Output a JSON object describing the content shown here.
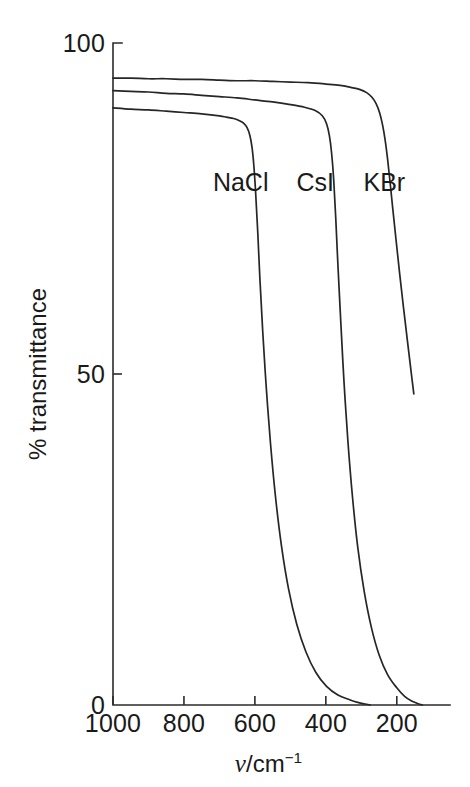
{
  "chart_data": {
    "type": "line",
    "title": "",
    "subtitle": "",
    "xlabel": "v/cm^-1",
    "xlabel_symbol": "ν",
    "xlabel_unit": "/cm",
    "xlabel_exponent": "−1",
    "ylabel": "% transmittance",
    "xlim": [
      1000,
      50
    ],
    "ylim": [
      0,
      100
    ],
    "x_ticks": [
      1000,
      800,
      600,
      400,
      200
    ],
    "x_tick_labels": [
      "1000",
      "800",
      "600",
      "400",
      "200"
    ],
    "y_ticks": [
      0,
      50,
      100
    ],
    "y_tick_labels": [
      "0",
      "50",
      "100"
    ],
    "x_axis_inverted": true,
    "grid": false,
    "legend": "inline-labels",
    "legend_position": "on-plot",
    "series": [
      {
        "name": "NaCl",
        "label": "NaCl",
        "plateau_transmittance": 89,
        "cutoff_wavenumber": 590,
        "zero_wavenumber": 285,
        "label_x": 640,
        "label_y": 79,
        "points": [
          [
            1000,
            90.2
          ],
          [
            950,
            90.0
          ],
          [
            900,
            89.9
          ],
          [
            850,
            89.7
          ],
          [
            800,
            89.5
          ],
          [
            750,
            89.3
          ],
          [
            700,
            89.0
          ],
          [
            680,
            88.8
          ],
          [
            660,
            88.6
          ],
          [
            645,
            88.3
          ],
          [
            632,
            87.9
          ],
          [
            622,
            87.2
          ],
          [
            614,
            86.0
          ],
          [
            608,
            84.2
          ],
          [
            603,
            81.5
          ],
          [
            598,
            77.5
          ],
          [
            592,
            71.5
          ],
          [
            586,
            64.5
          ],
          [
            578,
            56.5
          ],
          [
            568,
            48.0
          ],
          [
            556,
            39.5
          ],
          [
            542,
            31.5
          ],
          [
            525,
            24.0
          ],
          [
            505,
            17.5
          ],
          [
            482,
            12.2
          ],
          [
            456,
            8.0
          ],
          [
            428,
            4.9
          ],
          [
            398,
            2.8
          ],
          [
            366,
            1.5
          ],
          [
            333,
            0.8
          ],
          [
            310,
            0.4
          ],
          [
            290,
            0.15
          ],
          [
            275,
            0.0
          ]
        ]
      },
      {
        "name": "CsI",
        "label": "CsI",
        "plateau_transmittance": 92,
        "cutoff_wavenumber": 380,
        "zero_wavenumber": 150,
        "label_x": 430,
        "label_y": 79,
        "points": [
          [
            1000,
            92.8
          ],
          [
            950,
            92.7
          ],
          [
            900,
            92.6
          ],
          [
            850,
            92.4
          ],
          [
            800,
            92.3
          ],
          [
            750,
            92.1
          ],
          [
            700,
            91.9
          ],
          [
            650,
            91.7
          ],
          [
            600,
            91.4
          ],
          [
            550,
            91.1
          ],
          [
            500,
            90.7
          ],
          [
            460,
            90.3
          ],
          [
            430,
            89.8
          ],
          [
            410,
            89.0
          ],
          [
            398,
            87.8
          ],
          [
            390,
            86.0
          ],
          [
            384,
            83.5
          ],
          [
            378,
            79.5
          ],
          [
            372,
            73.5
          ],
          [
            366,
            66.5
          ],
          [
            358,
            58.0
          ],
          [
            349,
            49.0
          ],
          [
            338,
            40.0
          ],
          [
            325,
            31.5
          ],
          [
            310,
            23.8
          ],
          [
            292,
            17.2
          ],
          [
            272,
            11.8
          ],
          [
            250,
            7.6
          ],
          [
            226,
            4.6
          ],
          [
            200,
            2.6
          ],
          [
            178,
            1.3
          ],
          [
            158,
            0.6
          ],
          [
            140,
            0.2
          ],
          [
            128,
            0.0
          ]
        ]
      },
      {
        "name": "KBr",
        "label": "KBr",
        "plateau_transmittance": 94,
        "cutoff_wavenumber": 195,
        "zero_wavenumber": null,
        "truncated_at_right_edge": true,
        "label_x": 235,
        "label_y": 79,
        "points": [
          [
            1000,
            94.7
          ],
          [
            950,
            94.7
          ],
          [
            900,
            94.6
          ],
          [
            850,
            94.6
          ],
          [
            800,
            94.5
          ],
          [
            750,
            94.5
          ],
          [
            700,
            94.4
          ],
          [
            650,
            94.3
          ],
          [
            600,
            94.3
          ],
          [
            550,
            94.2
          ],
          [
            500,
            94.1
          ],
          [
            450,
            94.0
          ],
          [
            400,
            93.8
          ],
          [
            360,
            93.6
          ],
          [
            330,
            93.3
          ],
          [
            305,
            93.0
          ],
          [
            285,
            92.5
          ],
          [
            270,
            91.8
          ],
          [
            258,
            90.8
          ],
          [
            248,
            89.4
          ],
          [
            240,
            87.6
          ],
          [
            233,
            85.4
          ],
          [
            226,
            82.5
          ],
          [
            219,
            79.0
          ],
          [
            211,
            74.8
          ],
          [
            202,
            70.2
          ],
          [
            192,
            65.2
          ],
          [
            181,
            60.0
          ],
          [
            170,
            55.0
          ],
          [
            160,
            50.5
          ],
          [
            152,
            47.0
          ]
        ]
      }
    ]
  }
}
